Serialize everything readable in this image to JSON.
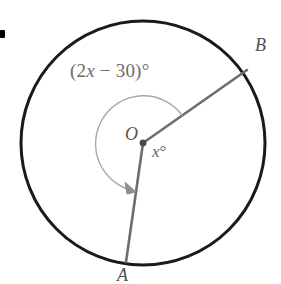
{
  "figure": {
    "type": "circle-with-central-angle",
    "colors": {
      "circle_stroke": "#1a1a1a",
      "radius_stroke": "#6e6e6e",
      "arc_stroke": "#a8a8a8",
      "label_text": "#5a5a5a",
      "center_dot": "#4a4a4a",
      "bullet": "#000000",
      "background": "#ffffff"
    },
    "geometry": {
      "center_x": 143,
      "center_y": 143,
      "radius": 122,
      "point_A_x": 126,
      "point_A_y": 261,
      "point_B_x": 247,
      "point_B_y": 70,
      "arc_radius": 48
    },
    "labels": {
      "center": "O",
      "point_a": "A",
      "point_b": "B",
      "reflex_angle_prefix": "(2",
      "reflex_angle_var": "x",
      "reflex_angle_suffix": " − 30)",
      "degree_symbol": "°",
      "inner_angle_var": "x",
      "inner_angle_degree": "°"
    }
  }
}
